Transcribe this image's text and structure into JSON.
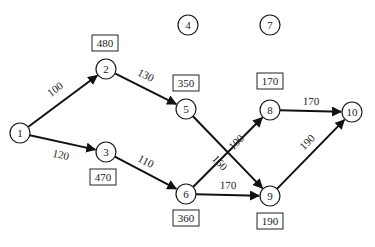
{
  "diagram": {
    "type": "network",
    "nodes": [
      {
        "id": "1",
        "label": "1"
      },
      {
        "id": "2",
        "label": "2"
      },
      {
        "id": "3",
        "label": "3"
      },
      {
        "id": "4",
        "label": "4"
      },
      {
        "id": "5",
        "label": "5"
      },
      {
        "id": "6",
        "label": "6"
      },
      {
        "id": "7",
        "label": "7"
      },
      {
        "id": "8",
        "label": "8"
      },
      {
        "id": "9",
        "label": "9"
      },
      {
        "id": "10",
        "label": "10"
      }
    ],
    "edges": [
      {
        "from": "1",
        "to": "2",
        "weight": "100"
      },
      {
        "from": "1",
        "to": "3",
        "weight": "120"
      },
      {
        "from": "2",
        "to": "5",
        "weight": "130"
      },
      {
        "from": "3",
        "to": "6",
        "weight": "110"
      },
      {
        "from": "5",
        "to": "9",
        "weight": "160"
      },
      {
        "from": "6",
        "to": "8",
        "weight": "190"
      },
      {
        "from": "6",
        "to": "9",
        "weight": "170"
      },
      {
        "from": "8",
        "to": "10",
        "weight": "170"
      },
      {
        "from": "9",
        "to": "10",
        "weight": "190"
      }
    ],
    "node_values": [
      {
        "node": "2",
        "value": "480"
      },
      {
        "node": "5",
        "value": "350"
      },
      {
        "node": "3",
        "value": "470"
      },
      {
        "node": "6",
        "value": "360"
      },
      {
        "node": "8",
        "value": "170"
      },
      {
        "node": "9",
        "value": "190"
      }
    ]
  }
}
